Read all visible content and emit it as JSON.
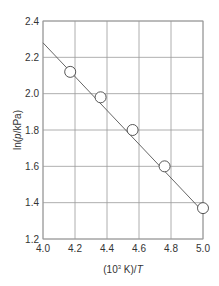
{
  "chart_data": {
    "type": "scatter",
    "title": "",
    "xlabel": "(10³ K)/T",
    "ylabel": "ln(p/kPa)",
    "xlim": [
      4.0,
      5.0
    ],
    "ylim": [
      1.2,
      2.4
    ],
    "grid": true,
    "x_ticks": [
      "4.0",
      "4.2",
      "4.4",
      "4.6",
      "4.8",
      "5.0"
    ],
    "y_ticks": [
      "1.2",
      "1.4",
      "1.6",
      "1.8",
      "2.0",
      "2.2",
      "2.4"
    ],
    "series": [
      {
        "name": "data",
        "marker": "open-circle",
        "x": [
          4.17,
          4.36,
          4.56,
          4.76,
          5.0
        ],
        "y": [
          2.12,
          1.98,
          1.8,
          1.6,
          1.37
        ]
      }
    ],
    "fit_line": {
      "x": [
        4.0,
        5.0
      ],
      "y": [
        2.28,
        1.35
      ]
    },
    "colors": {
      "grid": "#9a9a9a",
      "line": "#555555",
      "marker_edge": "#444444"
    }
  },
  "labels": {
    "xlabel_prefix": "(10",
    "xlabel_sup": "3",
    "xlabel_mid": " K)/",
    "xlabel_var": "T",
    "ylabel_prefix": "ln(",
    "ylabel_var": "p",
    "ylabel_suffix": "/kPa)"
  }
}
